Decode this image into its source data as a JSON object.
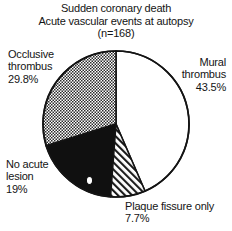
{
  "figure": {
    "title_lines": [
      "Sudden coronary death",
      "Acute vascular events at autopsy",
      "(n=168)"
    ]
  },
  "labels": {
    "occlusive": {
      "line1": "Occlusive",
      "line2": "thrombus",
      "line3": "29.8%"
    },
    "mural": {
      "line1": "Mural",
      "line2": "thrombus",
      "line3": "43.5%"
    },
    "noacute": {
      "line1": "No acute",
      "line2": "lesion",
      "line3": "19%"
    },
    "plaque": {
      "line1": "Plaque fissure only",
      "line2": "7.7%"
    }
  },
  "chart_data": {
    "type": "pie",
    "total_n": 168,
    "units": "percent",
    "start_angle_deg": 0,
    "direction": "clockwise",
    "legend_position": "outside-labels",
    "categories": [
      "Mural thrombus",
      "Plaque fissure only",
      "No acute lesion",
      "Occlusive thrombus"
    ],
    "values": [
      43.5,
      7.7,
      19.0,
      29.8
    ],
    "slices": [
      {
        "label": "Mural thrombus",
        "value": 43.5,
        "value_text": "43.5%",
        "fill": "solid-white",
        "color": "#ffffff",
        "start_deg": 0.0,
        "end_deg": 156.6
      },
      {
        "label": "Plaque fissure only",
        "value": 7.7,
        "value_text": "7.7%",
        "fill": "diagonal-hatch",
        "color": "#ffffff",
        "start_deg": 156.6,
        "end_deg": 184.3
      },
      {
        "label": "No acute lesion",
        "value": 19.0,
        "value_text": "19%",
        "fill": "solid-black",
        "color": "#101010",
        "start_deg": 184.3,
        "end_deg": 252.7
      },
      {
        "label": "Occlusive thrombus",
        "value": 29.8,
        "value_text": "29.8%",
        "fill": "checker-gray",
        "color": "#8c8c8c",
        "start_deg": 252.7,
        "end_deg": 360.0
      }
    ]
  }
}
